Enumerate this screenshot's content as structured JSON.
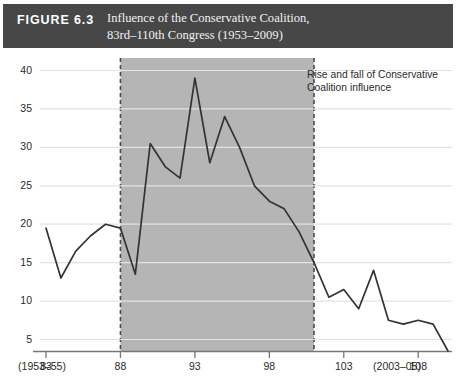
{
  "figure": {
    "number_label": "FIGURE 6.3",
    "title_line1": "Influence of the Conservative Coalition,",
    "title_line2": "83rd–110th Congress (1953–2009)",
    "header_bg": "#474747"
  },
  "legend": {
    "swatch_color": "#b5b5b5",
    "label_line1": "Rise and fall of Conservative",
    "label_line2": "Coalition influence"
  },
  "axis": {
    "y_ticks": [
      "5",
      "10",
      "15",
      "20",
      "25",
      "30",
      "35",
      "40"
    ],
    "x_ticks": [
      "83",
      "88",
      "93",
      "98",
      "103",
      "108"
    ],
    "x_range_left": "(1953–55)",
    "x_range_right": "(2003–05)"
  },
  "chart_data": {
    "type": "line",
    "title": "Influence of the Conservative Coalition, 83rd–110th Congress (1953–2009)",
    "xlabel": "Congress",
    "ylabel": "",
    "xlim": [
      83,
      110
    ],
    "ylim": [
      0,
      42
    ],
    "ytick_values": [
      5,
      10,
      15,
      20,
      25,
      30,
      35,
      40
    ],
    "xtick_values": [
      83,
      88,
      93,
      98,
      103,
      108
    ],
    "grid": "horizontal",
    "legend_position": "top-right",
    "line_color": "#333333",
    "shaded_region": {
      "label": "Rise and fall of Conservative Coalition influence",
      "x_start": 88,
      "x_end": 101,
      "fill": "#b5b5b5",
      "border_style": "dashed"
    },
    "x": [
      83,
      84,
      85,
      86,
      87,
      88,
      89,
      90,
      91,
      92,
      93,
      94,
      95,
      96,
      97,
      98,
      99,
      100,
      101,
      102,
      103,
      104,
      105,
      106,
      107,
      108,
      109,
      110
    ],
    "series": [
      {
        "name": "Conservative Coalition appearances (%)",
        "values": [
          19.5,
          13.0,
          16.5,
          18.5,
          20.0,
          19.5,
          13.5,
          30.5,
          27.5,
          26.0,
          39.0,
          28.0,
          34.0,
          30.0,
          25.0,
          23.0,
          22.0,
          19.0,
          15.0,
          10.5,
          11.5,
          9.0,
          14.0,
          7.5,
          7.0,
          7.5,
          7.0,
          3.5
        ]
      }
    ]
  }
}
